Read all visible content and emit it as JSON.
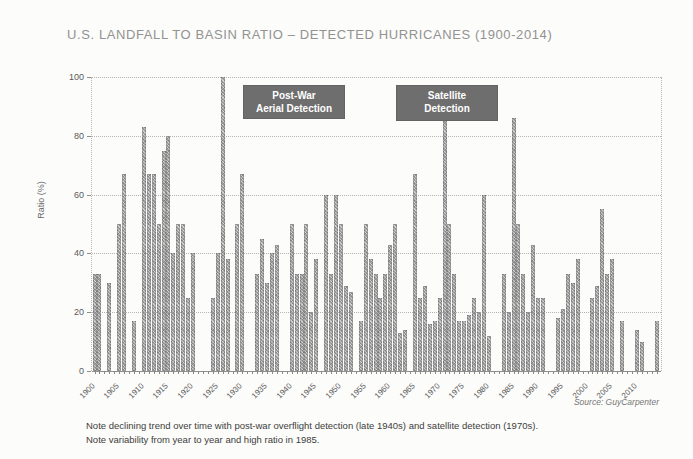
{
  "title": "U.S. LANDFALL TO BASIN RATIO – DETECTED HURRICANES (1900-2014)",
  "source": "Source: GuyCarpenter",
  "notes": {
    "line1": "Note declining trend over time with post-war overflight detection (late 1940s) and satellite detection (1970s).",
    "line2": "Note variability from year to year and high ratio in 1985."
  },
  "chart_data": {
    "type": "bar",
    "title": "U.S. LANDFALL TO BASIN RATIO – DETECTED HURRICANES (1900-2014)",
    "xlabel": "",
    "ylabel": "Ratio (%)",
    "ylim": [
      0,
      100
    ],
    "yticks": [
      0,
      20,
      40,
      60,
      80,
      100
    ],
    "grid": "dotted horizontal gridlines at each y tick",
    "legend": "none",
    "bar_color": "#a2a2a2",
    "bar_texture": "gray crosshatch",
    "xtick_labels": [
      "1900",
      "1905",
      "1910",
      "1915",
      "1920",
      "1925",
      "1930",
      "1935",
      "1940",
      "1945",
      "1950",
      "1955",
      "1960",
      "1965",
      "1970",
      "1975",
      "1980",
      "1985",
      "1990",
      "1995",
      "2000",
      "2005",
      "2010"
    ],
    "annotations": {
      "postwar": {
        "line1": "Post-War",
        "line2": "Aerial Detection",
        "box_color": "#6e6e6e",
        "text_color": "#ffffff"
      },
      "satellite": {
        "line1": "Satellite",
        "line2": "Detection",
        "box_color": "#6e6e6e",
        "text_color": "#ffffff"
      }
    },
    "years": [
      1900,
      1901,
      1902,
      1903,
      1904,
      1905,
      1906,
      1907,
      1908,
      1909,
      1910,
      1911,
      1912,
      1913,
      1914,
      1915,
      1916,
      1917,
      1918,
      1919,
      1920,
      1921,
      1922,
      1923,
      1924,
      1925,
      1926,
      1927,
      1928,
      1929,
      1930,
      1931,
      1932,
      1933,
      1934,
      1935,
      1936,
      1937,
      1938,
      1939,
      1940,
      1941,
      1942,
      1943,
      1944,
      1945,
      1946,
      1947,
      1948,
      1949,
      1950,
      1951,
      1952,
      1953,
      1954,
      1955,
      1956,
      1957,
      1958,
      1959,
      1960,
      1961,
      1962,
      1963,
      1964,
      1965,
      1966,
      1967,
      1968,
      1969,
      1970,
      1971,
      1972,
      1973,
      1974,
      1975,
      1976,
      1977,
      1978,
      1979,
      1980,
      1981,
      1982,
      1983,
      1984,
      1985,
      1986,
      1987,
      1988,
      1989,
      1990,
      1991,
      1992,
      1993,
      1994,
      1995,
      1996,
      1997,
      1998,
      1999,
      2000,
      2001,
      2002,
      2003,
      2004,
      2005,
      2006,
      2007,
      2008,
      2009,
      2010,
      2011,
      2012,
      2013,
      2014
    ],
    "values": [
      33,
      33,
      0,
      30,
      0,
      50,
      67,
      0,
      17,
      0,
      83,
      67,
      67,
      50,
      75,
      80,
      40,
      50,
      50,
      25,
      40,
      0,
      0,
      0,
      25,
      40,
      100,
      38,
      0,
      50,
      67,
      0,
      0,
      33,
      45,
      30,
      40,
      43,
      0,
      0,
      50,
      33,
      33,
      50,
      20,
      38,
      0,
      60,
      33,
      60,
      50,
      29,
      27,
      0,
      17,
      50,
      38,
      33,
      25,
      33,
      43,
      50,
      13,
      14,
      0,
      67,
      25,
      29,
      16,
      17,
      25,
      85,
      50,
      33,
      17,
      17,
      19,
      25,
      20,
      60,
      12,
      0,
      0,
      33,
      20,
      86,
      50,
      33,
      20,
      43,
      25,
      25,
      0,
      0,
      18,
      21,
      33,
      30,
      38,
      0,
      0,
      25,
      29,
      55,
      33,
      38,
      0,
      17,
      0,
      0,
      14,
      10,
      0,
      0,
      17
    ]
  }
}
